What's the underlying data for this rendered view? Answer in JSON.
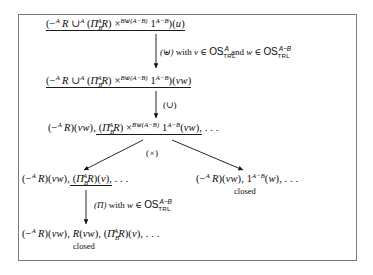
{
  "diagram": {
    "border_color": "#7a7a7a",
    "text_color": "#0a0a0a",
    "nodes": [
      {
        "id": "node1",
        "text": "(−ᴬ R ∪ᴬ (Πᴬᴮ R) ×ᴮ⊎(ᴬ−ᴮ) 1ᴬ−ᴮ)(u)",
        "underlined": true
      },
      {
        "id": "node2",
        "text": "(−ᴬ R ∪ᴬ (Πᴬᴮ R) ×ᴮ⊎(ᴬ−ᴮ) 1ᴬ−ᴮ)(vw)",
        "underlined": true
      },
      {
        "id": "node3",
        "text": "(−ᴬ R)(vw), (Πᴬᴮ R) ×ᴮ⊎(ᴬ−ᴮ) 1ᴬ−ᴮ(vw), . . .",
        "underlined": "partial"
      },
      {
        "id": "node4-left",
        "text": "(−ᴬ R)(vw), (Πᴬᴮ R)(v), . . .",
        "underlined": "partial"
      },
      {
        "id": "node4-right",
        "text": "(−ᴬ R)(vw), 1ᴬ−ᴮ(w), . . .",
        "underlined": false
      },
      {
        "id": "node5",
        "text": "(−ᴬ R)(vw), R(vw), (Πᴬᴮ R)(v), . . .",
        "underlined": false
      }
    ],
    "edge_labels": [
      {
        "id": "edge1",
        "rule": "(⊎)",
        "condition": "with v ∈ OSᴬTRL and w ∈ OSᴬ−ᴮTRL"
      },
      {
        "id": "edge2",
        "rule": "(∪)",
        "condition": ""
      },
      {
        "id": "edge3",
        "rule": "(×)",
        "condition": ""
      },
      {
        "id": "edge4",
        "rule": "(Π)",
        "condition": "with w ∈ OSᴬ−ᴮTRL"
      }
    ],
    "annotations": [
      {
        "id": "closed-right",
        "text": "closed"
      },
      {
        "id": "closed-bottom",
        "text": "closed"
      }
    ],
    "symbols": {
      "minus": "−",
      "union": "∪",
      "uplus": "⊎",
      "times": "×",
      "Pi": "Π",
      "in": "∈",
      "ellipsis": ". . .",
      "one": "1",
      "R": "R",
      "A": "A",
      "B": "B",
      "u": "u",
      "v": "v",
      "w": "w",
      "vw": "vw",
      "OS": "OS",
      "TRL": "TRL",
      "with": "with",
      "and": "and"
    }
  }
}
